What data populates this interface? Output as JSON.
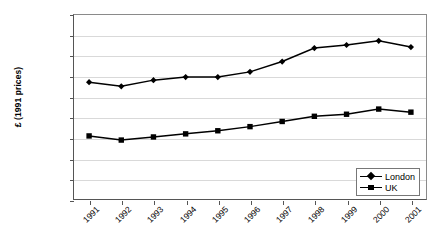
{
  "chart_data": {
    "type": "line",
    "title": "",
    "xlabel": "",
    "ylabel": "£ (1991 prices)",
    "categories": [
      "1991",
      "1992",
      "1993",
      "1994",
      "1995",
      "1996",
      "1997",
      "1998",
      "1999",
      "2000",
      "2001"
    ],
    "series": [
      {
        "name": "London",
        "marker": "diamond",
        "color": "#000000",
        "values": [
          11700,
          11500,
          11800,
          11950,
          11950,
          12200,
          12700,
          13350,
          13500,
          13700,
          13400
        ]
      },
      {
        "name": "UK",
        "marker": "square",
        "color": "#000000",
        "values": [
          9100,
          8900,
          9050,
          9200,
          9350,
          9550,
          9800,
          10050,
          10150,
          10400,
          10250
        ]
      }
    ],
    "ylim": [
      6000,
      15000
    ],
    "ytick_step": 1000,
    "yticks": [
      "15000",
      "14000",
      "13000",
      "12000",
      "11000",
      "10000",
      "9000",
      "8000",
      "7000",
      "6000"
    ],
    "grid": "horizontal",
    "legend_position": "bottom-right",
    "xtick_rotation": -45
  },
  "legend": {
    "items": [
      {
        "label": "London",
        "marker": "diamond"
      },
      {
        "label": "UK",
        "marker": "square"
      }
    ]
  }
}
